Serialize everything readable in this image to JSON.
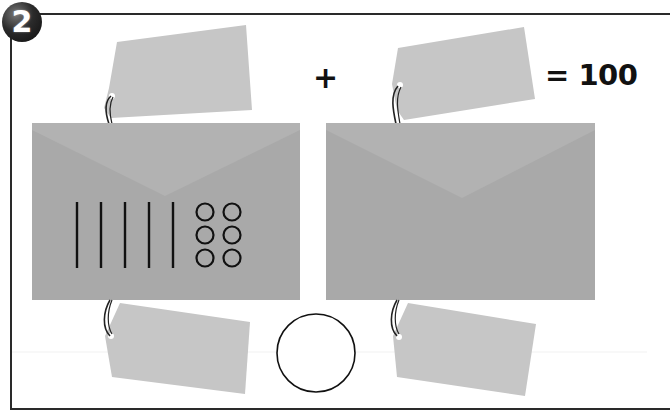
{
  "problem": {
    "step_number": "2",
    "plus_sign": "+",
    "equation_result": "= 100"
  },
  "envelopes": [
    {
      "name": "left-envelope",
      "tally_lines": 5,
      "circles": 6,
      "circle_layout": "2 columns x 3 rows"
    },
    {
      "name": "right-envelope",
      "tally_lines": 0,
      "circles": 0
    }
  ],
  "tags": [
    {
      "position": "top-left",
      "text": ""
    },
    {
      "position": "top-right",
      "text": ""
    },
    {
      "position": "bottom-left",
      "text": ""
    },
    {
      "position": "bottom-right",
      "text": ""
    }
  ],
  "answer_circle": {
    "value": ""
  },
  "colors": {
    "envelope": "#a9a9a9",
    "envelope_flap": "#b3b3b3",
    "tag": "#c6c6c6",
    "ink": "#111111",
    "frame": "#2a2a2a"
  }
}
